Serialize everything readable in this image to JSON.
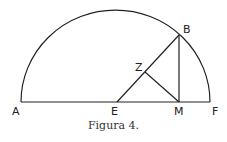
{
  "figure": {
    "caption": "Figura 4.",
    "labels": {
      "A": "A",
      "B": "B",
      "E": "E",
      "F": "F",
      "M": "M",
      "Z": "Z"
    }
  }
}
